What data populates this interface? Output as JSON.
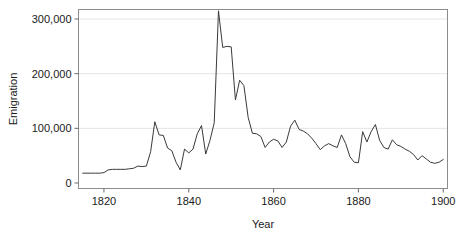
{
  "chart_data": {
    "type": "line",
    "title": "",
    "xlabel": "Year",
    "ylabel": "Emigration",
    "xlim": [
      1814,
      1901
    ],
    "ylim": [
      0,
      320000
    ],
    "xticks": [
      1820,
      1840,
      1860,
      1880,
      1900
    ],
    "xtick_labels": [
      "1820",
      "1840",
      "1860",
      "1880",
      "1900"
    ],
    "yticks": [
      0,
      100000,
      200000,
      300000
    ],
    "ytick_labels": [
      "0",
      "100,000",
      "200,000",
      "300,000"
    ],
    "grid": "horizontal",
    "grid_color": "#e4e4e4",
    "legend": "none",
    "line_color": "#3a3a3a",
    "line_width": 1,
    "frame_color": "#8c8c8c",
    "background": "#ffffff",
    "series": [
      {
        "name": "Emigration",
        "x": [
          1815,
          1816,
          1817,
          1818,
          1819,
          1820,
          1821,
          1822,
          1823,
          1824,
          1825,
          1826,
          1827,
          1828,
          1829,
          1830,
          1831,
          1832,
          1833,
          1834,
          1835,
          1836,
          1837,
          1838,
          1839,
          1840,
          1841,
          1842,
          1843,
          1844,
          1845,
          1846,
          1847,
          1848,
          1849,
          1850,
          1851,
          1852,
          1853,
          1854,
          1855,
          1856,
          1857,
          1858,
          1859,
          1860,
          1861,
          1862,
          1863,
          1864,
          1865,
          1866,
          1867,
          1868,
          1869,
          1870,
          1871,
          1872,
          1873,
          1874,
          1875,
          1876,
          1877,
          1878,
          1879,
          1880,
          1881,
          1882,
          1883,
          1884,
          1885,
          1886,
          1887,
          1888,
          1889,
          1890,
          1891,
          1892,
          1893,
          1894,
          1895,
          1896,
          1897,
          1898,
          1899,
          1900
        ],
        "y": [
          18000,
          18000,
          18000,
          18000,
          18000,
          19000,
          24000,
          25000,
          25000,
          25000,
          25000,
          26000,
          27000,
          31000,
          30000,
          31000,
          57000,
          112000,
          88000,
          87000,
          64000,
          59000,
          38000,
          24000,
          62000,
          55000,
          62000,
          90000,
          105000,
          53000,
          78000,
          110000,
          315000,
          248000,
          250000,
          249000,
          152000,
          188000,
          178000,
          120000,
          91000,
          90000,
          85000,
          65000,
          75000,
          80000,
          77000,
          65000,
          75000,
          104000,
          115000,
          98000,
          95000,
          90000,
          82000,
          72000,
          61000,
          68000,
          72000,
          68000,
          65000,
          88000,
          72000,
          48000,
          38000,
          37000,
          94000,
          75000,
          94000,
          107000,
          78000,
          65000,
          62000,
          79000,
          70000,
          67000,
          62000,
          58000,
          52000,
          42000,
          50000,
          44000,
          38000,
          36000,
          38000,
          43000
        ]
      }
    ]
  },
  "axes": {
    "x_axis_name": "year-axis",
    "y_axis_name": "emigration-axis"
  }
}
